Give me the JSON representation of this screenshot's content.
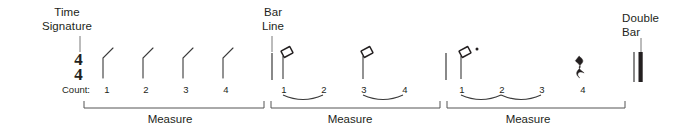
{
  "figure": {
    "type": "music-notation-rhythm-diagram",
    "background_color": "#ffffff",
    "ink_color": "#231f20",
    "stroke_color": "#3a3a3a"
  },
  "annotations": {
    "time_signature": "Time\nSignature",
    "bar_line": "Bar\nLine",
    "double_bar": "Double\nBar"
  },
  "staff": {
    "time_signature": {
      "numerator": "4",
      "denominator": "4",
      "display": "4/4"
    },
    "count_label": "Count:"
  },
  "measures": [
    {
      "label": "Measure",
      "notes": [
        {
          "symbol": "quarter-note",
          "beats": 1,
          "count": "1"
        },
        {
          "symbol": "quarter-note",
          "beats": 1,
          "count": "2"
        },
        {
          "symbol": "quarter-note",
          "beats": 1,
          "count": "3"
        },
        {
          "symbol": "quarter-note",
          "beats": 1,
          "count": "4"
        }
      ],
      "counts": [
        "1",
        "2",
        "3",
        "4"
      ],
      "slurs": []
    },
    {
      "label": "Measure",
      "notes": [
        {
          "symbol": "half-note",
          "beats": 2,
          "count": "1"
        },
        {
          "symbol": "half-note",
          "beats": 2,
          "count": "3"
        }
      ],
      "counts": [
        "1",
        "2",
        "3",
        "4"
      ],
      "slurs": [
        [
          "1",
          "2"
        ],
        [
          "3",
          "4"
        ]
      ]
    },
    {
      "label": "Measure",
      "notes": [
        {
          "symbol": "dotted-half-note",
          "beats": 3,
          "count": "1"
        },
        {
          "symbol": "quarter-rest",
          "beats": 1,
          "count": "4"
        }
      ],
      "counts": [
        "1",
        "2",
        "3",
        "4"
      ],
      "slurs": [
        [
          "1",
          "2"
        ],
        [
          "2",
          "3"
        ]
      ]
    }
  ],
  "barlines": [
    {
      "kind": "single",
      "name": "bar-line"
    },
    {
      "kind": "single",
      "name": "bar-line"
    },
    {
      "kind": "double",
      "name": "double-bar"
    }
  ]
}
